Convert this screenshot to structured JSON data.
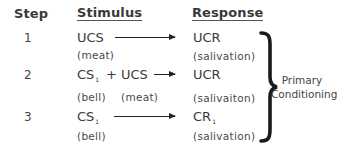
{
  "headers": {
    "step": "Step",
    "stimulus": "Stimulus",
    "response": "Response"
  },
  "rows": [
    {
      "step": "1",
      "stimulus": {
        "parts": [
          {
            "text": "UCS",
            "subscript": ""
          }
        ],
        "labels": [
          "(meat)"
        ]
      },
      "response": {
        "text": "UCR",
        "subscript": "",
        "label": "(salivation)"
      }
    },
    {
      "step": "2",
      "stimulus": {
        "parts": [
          {
            "text": "CS",
            "subscript": "1"
          },
          {
            "text": "+ UCS",
            "subscript": ""
          }
        ],
        "labels": [
          "(bell)",
          "(meat)"
        ]
      },
      "response": {
        "text": "UCR",
        "subscript": "",
        "label": "(salivaiton)"
      }
    },
    {
      "step": "3",
      "stimulus": {
        "parts": [
          {
            "text": "CS",
            "subscript": "1"
          }
        ],
        "labels": [
          "(bell)"
        ]
      },
      "response": {
        "text": "CR",
        "subscript": "1",
        "label": "(salivation)"
      }
    }
  ],
  "brace_label": {
    "line1": "Primary",
    "line2": "Conditioning"
  },
  "icons": {
    "arrow": "right-arrow-icon",
    "brace": "right-curly-brace"
  }
}
